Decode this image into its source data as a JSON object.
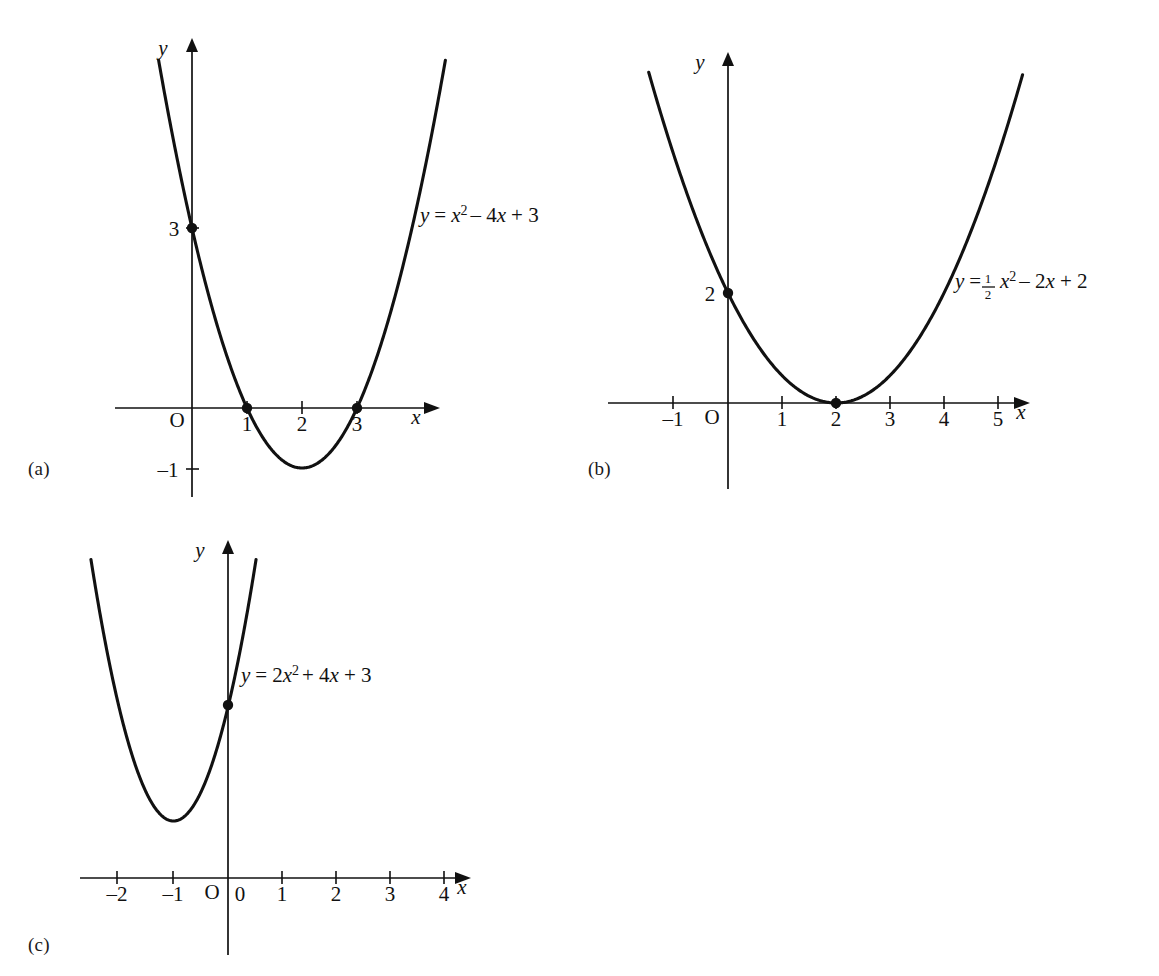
{
  "figure": {
    "panels": [
      {
        "id": "a",
        "caption": "(a)",
        "equation_text": "y = x2 - 4x + 3",
        "equation_parts": {
          "lhs": "y",
          "eq": "=",
          "var1": "x",
          "sup1": "2",
          "term2": "– 4",
          "var2": "x",
          "term3": "+ 3"
        },
        "axis_x_label": "x",
        "axis_y_label": "y",
        "origin_label": "O",
        "x_tick_labels": [
          "1",
          "2",
          "3"
        ],
        "y_tick_labels": [
          "3",
          "–1"
        ]
      },
      {
        "id": "b",
        "caption": "(b)",
        "equation_text": "y = 1/2 x2 - 2x + 2",
        "equation_parts": {
          "lhs": "y",
          "eq": "=",
          "frac_num": "1",
          "frac_den": "2",
          "var1": "x",
          "sup1": "2",
          "term2": "– 2",
          "var2": "x",
          "term3": "+ 2"
        },
        "axis_x_label": "x",
        "axis_y_label": "y",
        "origin_label": "O",
        "x_tick_labels": [
          "–1",
          "1",
          "2",
          "3",
          "4",
          "5"
        ],
        "y_tick_labels": [
          "2"
        ]
      },
      {
        "id": "c",
        "caption": "(c)",
        "equation_text": "y = 2x2 + 4x + 3",
        "equation_parts": {
          "lhs": "y",
          "eq": "=",
          "coef1": "2",
          "var1": "x",
          "sup1": "2",
          "term2": "+ 4",
          "var2": "x",
          "term3": "+ 3"
        },
        "axis_x_label": "x",
        "axis_y_label": "y",
        "origin_label": "O",
        "x_tick_labels": [
          "–2",
          "–1",
          "0",
          "1",
          "2",
          "3",
          "4"
        ],
        "y_tick_labels": []
      }
    ]
  },
  "chart_data": [
    {
      "type": "line",
      "id": "a",
      "title": "",
      "equation": "y = x^2 - 4x + 3",
      "coefficients": {
        "a": 1,
        "b": -4,
        "c": 3
      },
      "xlabel": "x",
      "ylabel": "y",
      "xlim": [
        -0.55,
        4.6
      ],
      "ylim": [
        -1.9,
        7.1
      ],
      "x_ticks": [
        1,
        2,
        3
      ],
      "y_ticks": [
        3,
        -1
      ],
      "grid": false,
      "legend": "none",
      "annotations": [
        "y = x² – 4x + 3"
      ],
      "marked_points": [
        {
          "x": 0,
          "y": 3,
          "label": "3"
        },
        {
          "x": 1,
          "y": 0,
          "label": "1"
        },
        {
          "x": 3,
          "y": 0,
          "label": "3"
        }
      ],
      "vertex": {
        "x": 2,
        "y": -1
      },
      "roots": [
        1,
        3
      ],
      "y_intercept": 3
    },
    {
      "type": "line",
      "id": "b",
      "title": "",
      "equation": "y = 0.5x^2 - 2x + 2",
      "coefficients": {
        "a": 0.5,
        "b": -2,
        "c": 2
      },
      "xlabel": "x",
      "ylabel": "y",
      "xlim": [
        -1.6,
        6.3
      ],
      "ylim": [
        -0.7,
        6.8
      ],
      "x_ticks": [
        -1,
        1,
        2,
        3,
        4,
        5
      ],
      "y_ticks": [
        2
      ],
      "grid": false,
      "legend": "none",
      "annotations": [
        "y = ½x² – 2x + 2"
      ],
      "marked_points": [
        {
          "x": 0,
          "y": 2,
          "label": "2"
        },
        {
          "x": 2,
          "y": 0,
          "label": "2"
        }
      ],
      "vertex": {
        "x": 2,
        "y": 0
      },
      "roots": [
        2
      ],
      "y_intercept": 2
    },
    {
      "type": "line",
      "id": "c",
      "title": "",
      "equation": "y = 2x^2 + 4x + 3",
      "coefficients": {
        "a": 2,
        "b": 4,
        "c": 3
      },
      "xlabel": "x",
      "ylabel": "y",
      "xlim": [
        -2.6,
        4.7
      ],
      "ylim": [
        -1.3,
        9.5
      ],
      "x_ticks": [
        -2,
        -1,
        0,
        1,
        2,
        3,
        4
      ],
      "y_ticks": [],
      "grid": false,
      "legend": "none",
      "annotations": [
        "y = 2x² + 4x + 3"
      ],
      "marked_points": [
        {
          "x": 0,
          "y": 3,
          "label": ""
        }
      ],
      "vertex": {
        "x": -1,
        "y": 1
      },
      "roots": [],
      "y_intercept": 3
    }
  ]
}
